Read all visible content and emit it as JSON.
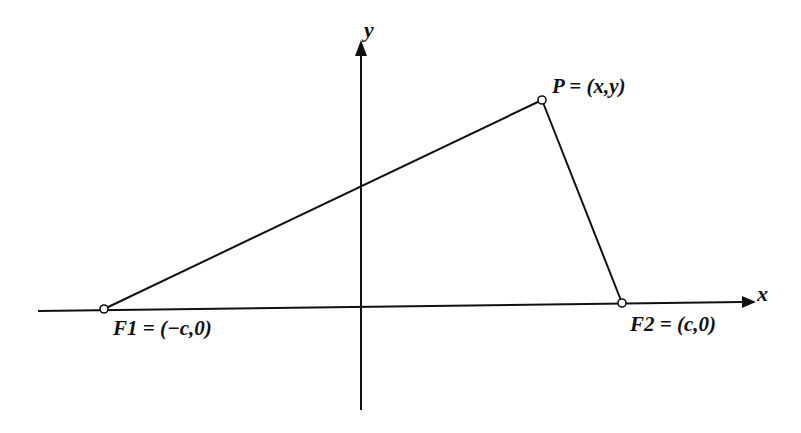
{
  "diagram": {
    "colors": {
      "stroke": "#111111",
      "point_fill": "#ffffff",
      "background": "#ffffff"
    },
    "axes": {
      "x_label": "x",
      "y_label": "y"
    },
    "points": [
      {
        "id": "F1",
        "label": "F1 = (−c,0)",
        "name": "F1",
        "coords": "(−c,0)"
      },
      {
        "id": "F2",
        "label": "F2 = (c,0)",
        "name": "F2",
        "coords": "(c,0)"
      },
      {
        "id": "P",
        "label": "P = (x,y)",
        "name": "P",
        "coords": "(x,y)"
      }
    ],
    "segments": [
      {
        "from": "F1",
        "to": "P"
      },
      {
        "from": "P",
        "to": "F2"
      }
    ]
  }
}
